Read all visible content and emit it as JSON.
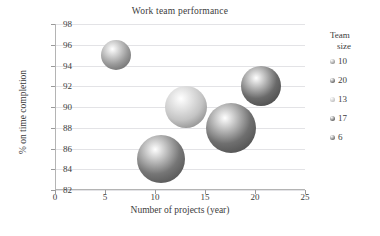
{
  "chart_data": {
    "type": "scatter",
    "title": "Work team performance",
    "xlabel": "Number of projects (year)",
    "ylabel": "% on time completion",
    "xlim": [
      0,
      25
    ],
    "ylim": [
      82,
      98
    ],
    "xticks": [
      "0",
      "5",
      "10",
      "15",
      "20",
      "25"
    ],
    "yticks": [
      "82",
      "84",
      "86",
      "88",
      "90",
      "92",
      "94",
      "96",
      "98"
    ],
    "grid": true,
    "legend_position": "right",
    "legend_title_line1": "Team",
    "legend_title_line2": "size",
    "points": [
      {
        "label": "10",
        "x": 6,
        "y": 95,
        "size": 10,
        "radius_px": 15,
        "color": "#9a9a9a"
      },
      {
        "label": "20",
        "x": 17.5,
        "y": 88,
        "size": 20,
        "radius_px": 25,
        "color": "#6f6f6f"
      },
      {
        "label": "13",
        "x": 13,
        "y": 90,
        "size": 13,
        "radius_px": 21,
        "color": "#c4c4c4"
      },
      {
        "label": "17",
        "x": 20.5,
        "y": 92,
        "size": 17,
        "radius_px": 20,
        "color": "#6a6a6a"
      },
      {
        "label": "6",
        "x": 10.5,
        "y": 85,
        "size": 6,
        "radius_px": 24,
        "color": "#767676"
      }
    ]
  }
}
